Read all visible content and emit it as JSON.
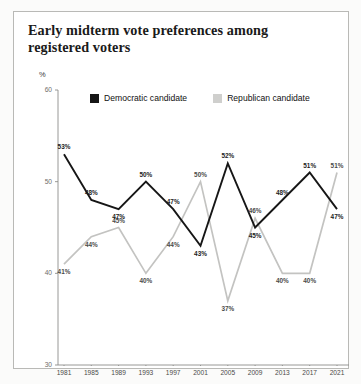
{
  "figure": {
    "title": "Early midterm vote preferences among registered voters",
    "y_axis_unit": "%",
    "footnote": ""
  },
  "legend": {
    "position": "top",
    "items": [
      {
        "label": "Democratic candidate",
        "color": "#161616",
        "key": "democratic"
      },
      {
        "label": "Republican candidate",
        "color": "#cfcfcd",
        "key": "republican"
      }
    ]
  },
  "chart_data": {
    "type": "line",
    "title": "Early midterm vote preferences among registered voters",
    "subtitle": "",
    "xlabel": "",
    "ylabel": "%",
    "ylim": [
      30,
      60
    ],
    "yticks": [
      30,
      40,
      50,
      60
    ],
    "grid": false,
    "legend_position": "top",
    "categories": [
      "1981",
      "1985",
      "1989",
      "1993",
      "1997",
      "2001",
      "2005",
      "2009",
      "2013",
      "2017",
      "2021"
    ],
    "series": [
      {
        "name": "Democratic candidate",
        "color": "#161616",
        "values": [
          53,
          48,
          47,
          50,
          47,
          43,
          52,
          45,
          48,
          51,
          47
        ],
        "labels": [
          "53%",
          "48%",
          "47%",
          "50%",
          "47%",
          "43%",
          "52%",
          "45%",
          "48%",
          "51%",
          "47%"
        ]
      },
      {
        "name": "Republican candidate",
        "color": "#cfcfcd",
        "values": [
          41,
          44,
          45,
          40,
          44,
          50,
          37,
          46,
          40,
          40,
          51
        ],
        "labels": [
          "41%",
          "44%",
          "45%",
          "40%",
          "44%",
          "50%",
          "37%",
          "46%",
          "40%",
          "40%",
          "51%"
        ]
      }
    ]
  }
}
